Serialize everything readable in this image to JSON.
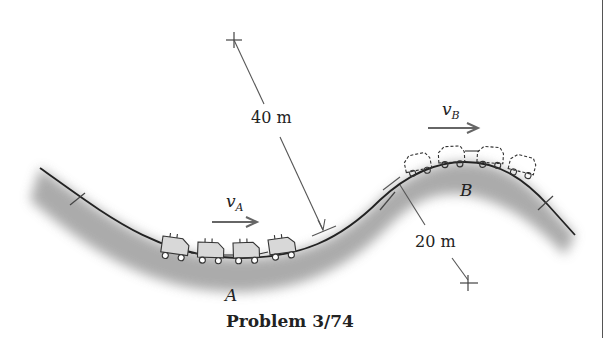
{
  "figure": {
    "caption": "Problem 3/74",
    "labels": {
      "point_a": "A",
      "point_b": "B",
      "velocity_a": {
        "symbol": "v",
        "subscript": "A"
      },
      "velocity_b": {
        "symbol": "v",
        "subscript": "B"
      },
      "radius_a": "40 m",
      "radius_b": "20 m"
    },
    "track": {
      "fill_shade": "#9a9a9a",
      "line_color": "#222222"
    },
    "train_a": {
      "cars": 4,
      "style": "solid"
    },
    "train_b": {
      "cars": 4,
      "style": "dashed"
    }
  }
}
